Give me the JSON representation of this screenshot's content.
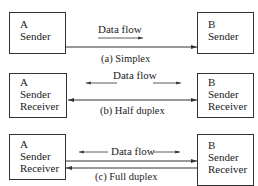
{
  "panels": [
    {
      "id": "simplex",
      "caption": "(a) Simplex",
      "flow_label": "Data flow",
      "left_box": {
        "letter": "A",
        "lines": [
          "Sender"
        ]
      },
      "right_box": {
        "letter": "B",
        "lines": [
          "Sender"
        ]
      }
    },
    {
      "id": "half-duplex",
      "caption": "(b) Half duplex",
      "flow_label": "Data flow",
      "left_box": {
        "letter": "A",
        "lines": [
          "Sender",
          "Receiver"
        ]
      },
      "right_box": {
        "letter": "B",
        "lines": [
          "Sender",
          "Receiver"
        ]
      }
    },
    {
      "id": "full-duplex",
      "caption": "(c) Full duplex",
      "flow_label": "Data flow",
      "left_box": {
        "letter": "A",
        "lines": [
          "Sender",
          "Receiver"
        ]
      },
      "right_box": {
        "letter": "B",
        "lines": [
          "Sender",
          "Receiver"
        ]
      }
    }
  ]
}
